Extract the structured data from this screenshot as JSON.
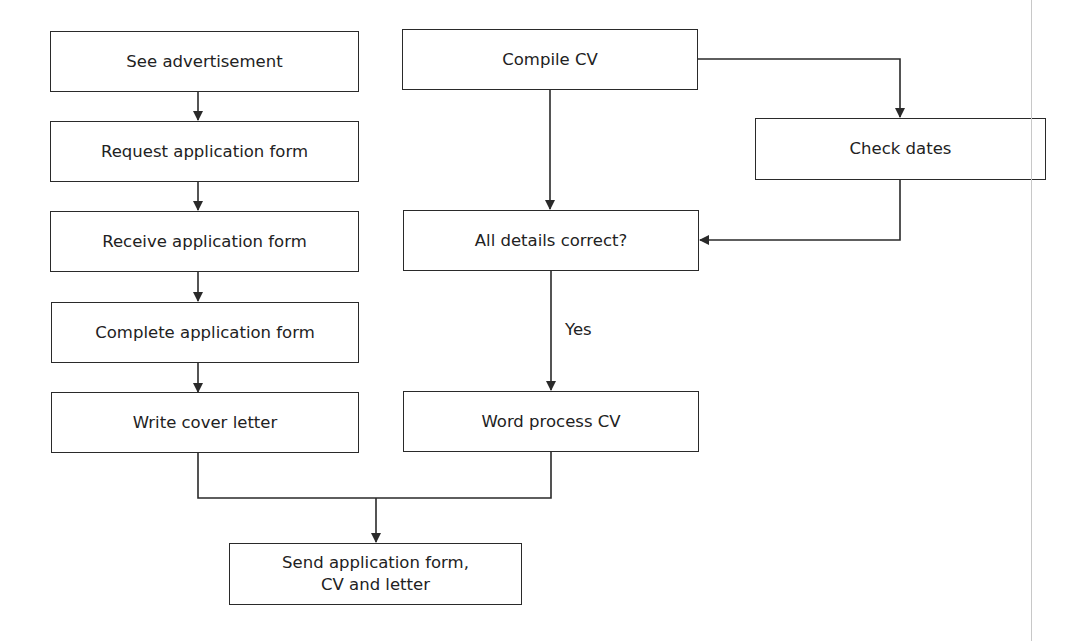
{
  "diagram": {
    "type": "flowchart",
    "nodes": {
      "see_ad": "See advertisement",
      "request_form": "Request application form",
      "receive_form": "Receive application form",
      "complete_form": "Complete application form",
      "write_letter": "Write cover letter",
      "compile_cv": "Compile CV",
      "check_dates": "Check dates",
      "all_correct": "All details correct?",
      "word_process": "Word process CV",
      "send": "Send application form,\nCV and letter"
    },
    "edge_labels": {
      "yes": "Yes"
    },
    "edges": [
      [
        "see_ad",
        "request_form"
      ],
      [
        "request_form",
        "receive_form"
      ],
      [
        "receive_form",
        "complete_form"
      ],
      [
        "complete_form",
        "write_letter"
      ],
      [
        "compile_cv",
        "all_correct"
      ],
      [
        "compile_cv",
        "check_dates"
      ],
      [
        "check_dates",
        "all_correct"
      ],
      [
        "all_correct",
        "word_process",
        "Yes"
      ],
      [
        "write_letter",
        "send"
      ],
      [
        "word_process",
        "send"
      ]
    ],
    "colors": {
      "stroke": "#2a2a2a",
      "text": "#222222",
      "background": "#ffffff"
    }
  }
}
